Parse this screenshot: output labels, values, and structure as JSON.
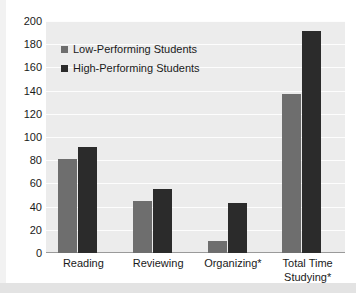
{
  "chart_data": {
    "type": "bar",
    "title": "",
    "xlabel": "",
    "ylabel": "",
    "ylim": [
      0,
      200
    ],
    "ytick_step": 20,
    "yticks": [
      "200",
      "180",
      "160",
      "140",
      "120",
      "100",
      "80",
      "60",
      "40",
      "20",
      "0"
    ],
    "grid": true,
    "legend_position": "inside-top-left",
    "categories": [
      "Reading",
      "Reviewing",
      "Organizing*",
      "Total Time Studying*"
    ],
    "category_lines": [
      [
        "Reading"
      ],
      [
        "Reviewing"
      ],
      [
        "Organizing*"
      ],
      [
        "Total Time",
        "Studying*"
      ]
    ],
    "series": [
      {
        "name": "Low-Performing Students",
        "color": "#6e6e6e",
        "values": [
          81,
          45,
          10,
          137
        ]
      },
      {
        "name": "High-Performing Students",
        "color": "#2b2b2b",
        "values": [
          91,
          55,
          43,
          191
        ]
      }
    ]
  },
  "style": {
    "plot_background": "#ececec",
    "page_background": "#ffffff",
    "gridline_color": "#fdfdfd",
    "axis_color": "#9a9a9a",
    "text_color": "#1a1a1a",
    "band_color": "#e3e3e3"
  }
}
